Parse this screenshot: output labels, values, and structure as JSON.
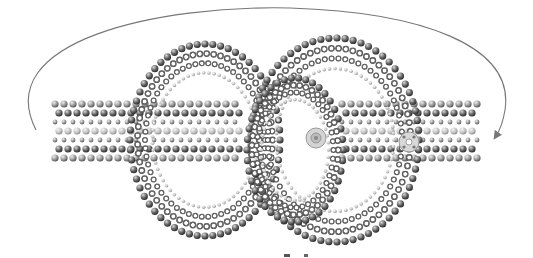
{
  "diagram": {
    "arrow": {
      "direction": "clockwise",
      "meaning": "wrap-around"
    },
    "colors": {
      "background": "#ffffff",
      "arrow": "#777777",
      "bead_dark": "#3a3a3a",
      "bead_mid": "#8a8a8a",
      "bead_light": "#c8c8c8",
      "snap": "#b0b0b0"
    },
    "parts": [
      {
        "id": "left-strap"
      },
      {
        "id": "left-loop"
      },
      {
        "id": "center-loop"
      },
      {
        "id": "right-loop"
      },
      {
        "id": "right-strap"
      },
      {
        "id": "snap-male"
      },
      {
        "id": "snap-female"
      }
    ]
  }
}
